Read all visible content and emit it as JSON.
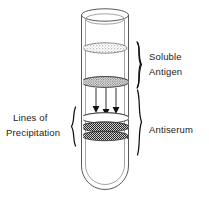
{
  "figure": {
    "background_color": "#ffffff",
    "ink_color": "#1a1a1a",
    "width": 209,
    "height": 202
  },
  "labels": {
    "soluble_antigen": {
      "line1": "Soluble",
      "line2": "Antigen",
      "position": "right-upper"
    },
    "antiserum": {
      "line1": "Antiserum",
      "position": "right-lower"
    },
    "lines_of_precipitation": {
      "line1": "Lines of",
      "line2": "Precipitation",
      "position": "left-middle"
    }
  },
  "braces": [
    {
      "name": "soluble-antigen-brace",
      "orientation": "right-facing",
      "spans_label": "Soluble Antigen",
      "top_y": 42,
      "bottom_y": 88
    },
    {
      "name": "antiserum-brace",
      "orientation": "right-facing",
      "spans_label": "Antiserum",
      "top_y": 89,
      "bottom_y": 156
    },
    {
      "name": "lines-of-precipitation-brace",
      "orientation": "left-facing",
      "spans_label": "Lines of Precipitation",
      "top_y": 107,
      "bottom_y": 146
    }
  ],
  "tube": {
    "name": "test-tube",
    "shape": "round-bottom test tube, open top",
    "left_x": 82,
    "right_x": 130,
    "top_y": 12,
    "bottom_y": 190,
    "rim_ellipse_ry": 6,
    "wall_color": "#5a5a5a",
    "inner_wall_color": "#8c8c8c"
  },
  "contents": {
    "upper_band": {
      "name": "soluble-antigen-band-upper",
      "center_y": 48,
      "rx": 22,
      "ry": 5,
      "fill": "stippled-gray",
      "description": "stippled ellipse of soluble antigen"
    },
    "lower_band": {
      "name": "soluble-antigen-band-lower",
      "center_y": 82,
      "rx": 24,
      "ry": 5,
      "fill": "stippled-gray-dense",
      "description": "denser stippled antigen layer at interface"
    },
    "arrows": {
      "name": "diffusion-arrows",
      "count": 3,
      "direction": "down",
      "x_positions": [
        96,
        106,
        116
      ],
      "top_y": 88,
      "tip_y": 113,
      "description": "antigen diffusing downward into antiserum"
    },
    "precipitation_bands": [
      {
        "name": "precipitation-band-1",
        "center_y": 118,
        "rx": 24,
        "ry": 5,
        "fill": "white"
      },
      {
        "name": "precipitation-band-2",
        "center_y": 127,
        "rx": 24,
        "ry": 5,
        "fill": "stippled-dark"
      },
      {
        "name": "precipitation-band-3",
        "center_y": 136,
        "rx": 23,
        "ry": 4.5,
        "fill": "stippled-dark"
      }
    ]
  }
}
